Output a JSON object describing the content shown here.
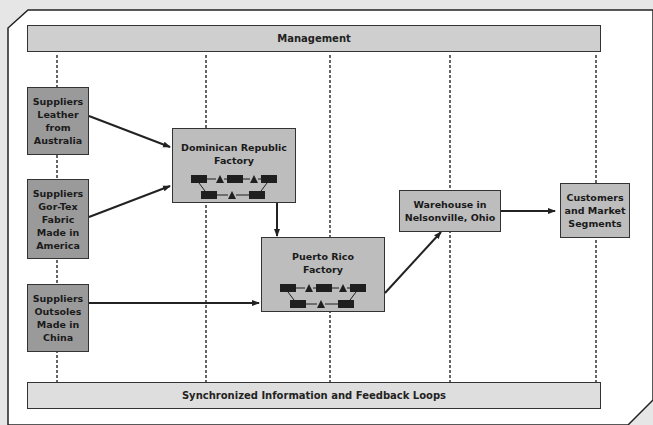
{
  "management": {
    "label": "Management"
  },
  "feedback": {
    "label": "Synchronized Information and Feedback Loops"
  },
  "suppliers": [
    {
      "lines": [
        "Suppliers",
        "Leather",
        "from",
        "Australia"
      ]
    },
    {
      "lines": [
        "Suppliers",
        "Gor-Tex",
        "Fabric",
        "Made in",
        "America"
      ]
    },
    {
      "lines": [
        "Suppliers",
        "Outsoles",
        "Made in",
        "China"
      ]
    }
  ],
  "factories": [
    {
      "lines": [
        "Dominican Republic",
        "Factory"
      ],
      "process_icon": "process-flow-icon"
    },
    {
      "lines": [
        "Puerto Rico",
        "Factory"
      ],
      "process_icon": "process-flow-icon"
    }
  ],
  "warehouse": {
    "lines": [
      "Warehouse in",
      "Nelsonville, Ohio"
    ]
  },
  "customers": {
    "lines": [
      "Customers",
      "and Market",
      "Segments"
    ]
  },
  "colors": {
    "supplier_fill": "#9a9a9a",
    "node_fill": "#bdbdbd",
    "band_fill": "#cfcfcf",
    "frame_bg": "#e6e6e6",
    "line": "#222222"
  }
}
